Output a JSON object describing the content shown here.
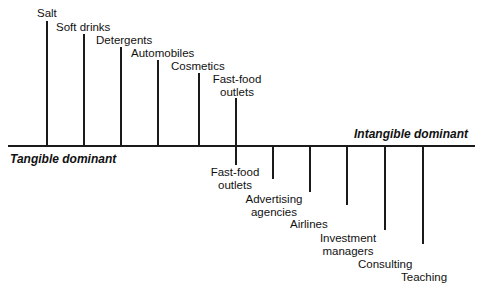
{
  "diagram": {
    "poles": {
      "left": "Tangible dominant",
      "right": "Intangible dominant"
    },
    "tangible_items": [
      {
        "line1": "Salt",
        "line2": ""
      },
      {
        "line1": "Soft drinks",
        "line2": ""
      },
      {
        "line1": "Detergents",
        "line2": ""
      },
      {
        "line1": "Automobiles",
        "line2": ""
      },
      {
        "line1": "Cosmetics",
        "line2": ""
      },
      {
        "line1": "Fast-food",
        "line2": "outlets"
      }
    ],
    "intangible_items": [
      {
        "line1": "Fast-food",
        "line2": "outlets"
      },
      {
        "line1": "Advertising",
        "line2": "agencies"
      },
      {
        "line1": "Airlines",
        "line2": ""
      },
      {
        "line1": "Investment",
        "line2": "managers"
      },
      {
        "line1": "Consulting",
        "line2": ""
      },
      {
        "line1": "Teaching",
        "line2": ""
      }
    ]
  }
}
